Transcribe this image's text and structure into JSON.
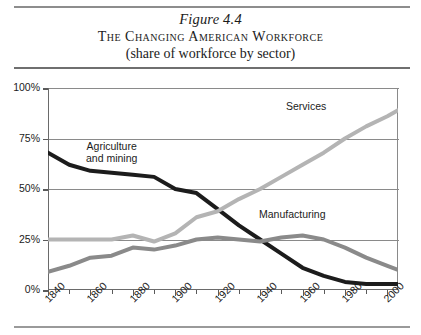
{
  "figure": {
    "number": "Figure 4.4",
    "title": "The Changing American Workforce",
    "subtitle": "(share of workforce by sector)"
  },
  "chart_data": {
    "type": "line",
    "title": "The Changing American Workforce",
    "subtitle": "(share of workforce by sector)",
    "xlabel": "",
    "ylabel": "",
    "xlim": [
      1840,
      2005
    ],
    "ylim": [
      0,
      100
    ],
    "grid": true,
    "legend": "inline-labels",
    "ytick_labels": [
      "0%",
      "25%",
      "50%",
      "75%",
      "100%"
    ],
    "ytick_values": [
      0,
      25,
      50,
      75,
      100
    ],
    "xtick_labels": [
      "1840",
      "1860",
      "1880",
      "1900",
      "1920",
      "1940",
      "1960",
      "1980",
      "2000"
    ],
    "xtick_values": [
      1840,
      1860,
      1880,
      1900,
      1920,
      1940,
      1960,
      1980,
      2000
    ],
    "xtick_minor_values": [
      1850,
      1870,
      1890,
      1910,
      1930,
      1950,
      1970,
      1990
    ],
    "x": [
      1840,
      1850,
      1860,
      1870,
      1880,
      1890,
      1900,
      1910,
      1920,
      1930,
      1940,
      1950,
      1960,
      1970,
      1980,
      1990,
      2000,
      2005
    ],
    "series": [
      {
        "name": "Agriculture and mining",
        "color": "#1c1c1c",
        "values": [
          68,
          62,
          59,
          58,
          57,
          56,
          50,
          48,
          40,
          32,
          25,
          18,
          11,
          7,
          4,
          3,
          3,
          3
        ]
      },
      {
        "name": "Manufacturing",
        "color": "#8a8a8a",
        "values": [
          9,
          12,
          16,
          17,
          21,
          20,
          22,
          25,
          26,
          25,
          24,
          26,
          27,
          25,
          21,
          16,
          12,
          10
        ]
      },
      {
        "name": "Services",
        "color": "#b4b4b4",
        "values": [
          25,
          25,
          25,
          25,
          27,
          24,
          28,
          36,
          39,
          45,
          50,
          56,
          62,
          68,
          75,
          81,
          86,
          89
        ]
      }
    ]
  },
  "labels": {
    "services": "Services",
    "agriculture_line1": "Agriculture",
    "agriculture_line2": "and mining",
    "manufacturing": "Manufacturing"
  },
  "colors": {
    "agriculture": "#1c1c1c",
    "manufacturing": "#8a8a8a",
    "services": "#b4b4b4",
    "axis": "#6a6a6a",
    "grid": "#8a8a8a",
    "rule": "#8d8d8d",
    "text": "#1b1b1b",
    "background": "#ffffff"
  }
}
